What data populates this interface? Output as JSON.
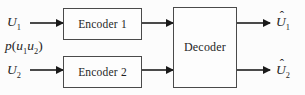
{
  "diagram_type": "block-diagram",
  "topic": "distributed source coding (Slepian-Wolf) system",
  "colors": {
    "background": "#fcfcfc",
    "line": "#4a4a4a",
    "arrowhead": "#1a1a1a",
    "text": "#1f1f1f",
    "box_fill": "#fdfdfd"
  },
  "blocks": {
    "encoder1": {
      "label": "Encoder 1"
    },
    "encoder2": {
      "label": "Encoder 2"
    },
    "decoder": {
      "label": "Decoder"
    }
  },
  "labels": {
    "input1": {
      "base": "U",
      "sub": "1"
    },
    "input2": {
      "base": "U",
      "sub": "2"
    },
    "joint": {
      "p": "p",
      "open": "(",
      "u1": "u",
      "s1": "1",
      "u2": "u",
      "s2": "2",
      "close": ")"
    },
    "output1": {
      "accent": "ˆ",
      "base": "U",
      "sub": "1"
    },
    "output2": {
      "accent": "ˆ",
      "base": "U",
      "sub": "2"
    }
  },
  "connections": [
    "input1 -> encoder1",
    "input2 -> encoder2",
    "encoder1 -> decoder",
    "encoder2 -> decoder",
    "decoder -> output1",
    "decoder -> output2"
  ]
}
